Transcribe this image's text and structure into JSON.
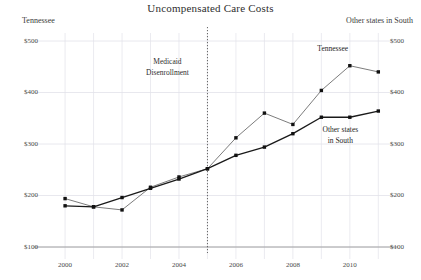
{
  "chart_data": {
    "type": "line",
    "title": "Uncompensated Care Costs",
    "xlabel": "",
    "ylabel": "",
    "grid": true,
    "legend_position": "inline-annotation",
    "x": [
      2000,
      2001,
      2002,
      2003,
      2004,
      2005,
      2006,
      2007,
      2008,
      2009,
      2010,
      2011
    ],
    "xlim": [
      1999.4,
      2011.2
    ],
    "xticks": [
      2000,
      2002,
      2004,
      2006,
      2008,
      2010
    ],
    "xticklabels": [
      "2000",
      "2002",
      "2004",
      "2006",
      "2008",
      "2010"
    ],
    "left_axis": {
      "label": "Tennessee",
      "ylim": [
        100,
        500
      ],
      "yticks": [
        100,
        200,
        300,
        400,
        500
      ],
      "yticklabels": [
        "$100",
        "$200",
        "$300",
        "$400",
        "$500"
      ]
    },
    "right_axis": {
      "label": "Other states in South",
      "ylim": [
        100,
        500
      ],
      "yticks": [
        100,
        200,
        300,
        400,
        500
      ],
      "yticklabels": [
        "$100",
        "$200",
        "$300",
        "$400",
        "$500"
      ]
    },
    "series": [
      {
        "name": "Tennessee",
        "axis": "left",
        "color": "#6d6d6d",
        "marker": "square",
        "values": [
          194,
          178,
          172,
          216,
          236,
          252,
          312,
          360,
          338,
          404,
          452,
          440
        ]
      },
      {
        "name": "Other states in South",
        "axis": "right",
        "color": "#1a1a1a",
        "marker": "square",
        "values": [
          180,
          178,
          196,
          214,
          232,
          252,
          278,
          294,
          320,
          352,
          352,
          364
        ]
      }
    ],
    "annotations": [
      {
        "name": "medicaid-disenrollment",
        "line1": "Medicaid",
        "line2": "Disenrollment",
        "x": 2005,
        "vline": true,
        "vline_style": "dotted"
      }
    ],
    "series_labels": [
      {
        "name": "tennessee-label",
        "line1": "Tennessee",
        "line2": ""
      },
      {
        "name": "other-states-label",
        "line1": "Other states",
        "line2": "in South"
      }
    ],
    "colors": {
      "grid": "#e2e2ea",
      "axis": "#9a9a9a",
      "tennessee": "#6d6d6d",
      "other_states": "#1a1a1a",
      "text": "#2b2b2b"
    }
  }
}
